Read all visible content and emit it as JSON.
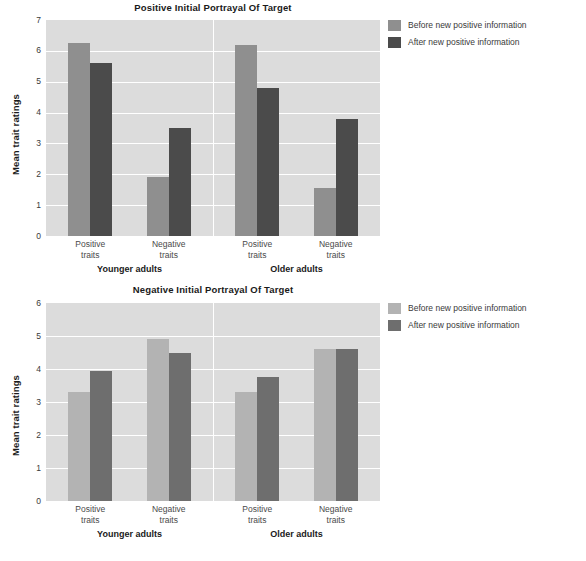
{
  "figure": {
    "ylabel": "Mean trait ratings",
    "group_labels": [
      "Younger adults",
      "Older adults"
    ],
    "trait_labels": [
      "Positive\ntraits",
      "Negative\ntraits"
    ],
    "legend_labels": [
      "Before new positive information",
      "After new positive information"
    ]
  },
  "panels": [
    {
      "id": "positive-initial",
      "title": "Positive Initial Portrayal Of Target",
      "ylabel": "Mean trait ratings",
      "yticks": [
        "7",
        "6",
        "5",
        "4",
        "3",
        "2",
        "1",
        "0"
      ],
      "colors": {
        "before": "#8f8f8f",
        "after": "#4b4b4b",
        "plot_bg": "#dcdcdc",
        "grid": "#ffffff"
      },
      "legend": [
        {
          "label": "Before new positive information",
          "color": "#8f8f8f"
        },
        {
          "label": "After new positive information",
          "color": "#4b4b4b"
        }
      ],
      "groups": [
        {
          "name": "Younger adults",
          "clusters": [
            {
              "label": "Positive\ntraits",
              "before": 6.25,
              "after": 5.6
            },
            {
              "label": "Negative\ntraits",
              "before": 1.9,
              "after": 3.5
            }
          ]
        },
        {
          "name": "Older adults",
          "clusters": [
            {
              "label": "Positive\ntraits",
              "before": 6.2,
              "after": 4.8
            },
            {
              "label": "Negative\ntraits",
              "before": 1.55,
              "after": 3.8
            }
          ]
        }
      ]
    },
    {
      "id": "negative-initial",
      "title": "Negative Initial Portrayal Of Target",
      "ylabel": "Mean trait ratings",
      "yticks": [
        "6",
        "5",
        "4",
        "3",
        "2",
        "1",
        "0"
      ],
      "colors": {
        "before": "#b3b3b3",
        "after": "#6e6e6e",
        "plot_bg": "#dcdcdc",
        "grid": "#ffffff"
      },
      "legend": [
        {
          "label": "Before new positive information",
          "color": "#b3b3b3"
        },
        {
          "label": "After new positive information",
          "color": "#6e6e6e"
        }
      ],
      "groups": [
        {
          "name": "Younger adults",
          "clusters": [
            {
              "label": "Positive\ntraits",
              "before": 3.3,
              "after": 3.95
            },
            {
              "label": "Negative\ntraits",
              "before": 4.9,
              "after": 4.5
            }
          ]
        },
        {
          "name": "Older adults",
          "clusters": [
            {
              "label": "Positive\ntraits",
              "before": 3.3,
              "after": 3.75
            },
            {
              "label": "Negative\ntraits",
              "before": 4.6,
              "after": 4.6
            }
          ]
        }
      ]
    }
  ],
  "chart_data": [
    {
      "type": "bar",
      "title": "Positive Initial Portrayal Of Target",
      "xlabel": "",
      "ylabel": "Mean trait ratings",
      "ylim": [
        0,
        7
      ],
      "yticks": [
        0,
        1,
        2,
        3,
        4,
        5,
        6,
        7
      ],
      "grid": true,
      "legend_position": "right",
      "categories": [
        "Younger adults – Positive traits",
        "Younger adults – Negative traits",
        "Older adults – Positive traits",
        "Older adults – Negative traits"
      ],
      "series": [
        {
          "name": "Before new positive information",
          "values": [
            6.25,
            1.9,
            6.2,
            1.55
          ]
        },
        {
          "name": "After new positive information",
          "values": [
            5.6,
            3.5,
            4.8,
            3.8
          ]
        }
      ]
    },
    {
      "type": "bar",
      "title": "Negative Initial Portrayal Of Target",
      "xlabel": "",
      "ylabel": "Mean trait ratings",
      "ylim": [
        0,
        6
      ],
      "yticks": [
        0,
        1,
        2,
        3,
        4,
        5,
        6
      ],
      "grid": true,
      "legend_position": "right",
      "categories": [
        "Younger adults – Positive traits",
        "Younger adults – Negative traits",
        "Older adults – Positive traits",
        "Older adults – Negative traits"
      ],
      "series": [
        {
          "name": "Before new positive information",
          "values": [
            3.3,
            4.9,
            3.3,
            4.6
          ]
        },
        {
          "name": "After new positive information",
          "values": [
            3.95,
            4.5,
            3.75,
            4.6
          ]
        }
      ]
    }
  ]
}
